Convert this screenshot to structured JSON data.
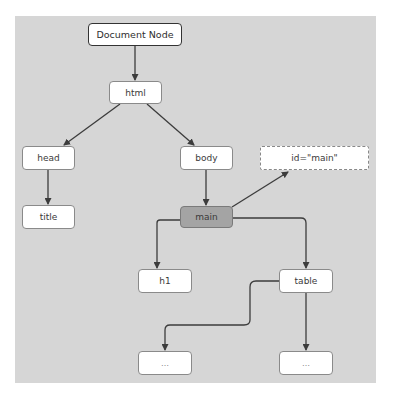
{
  "diagram": {
    "nodes": {
      "document": {
        "label": "Document Node"
      },
      "html": {
        "label": "html"
      },
      "head": {
        "label": "head"
      },
      "body": {
        "label": "body"
      },
      "title": {
        "label": "title"
      },
      "main": {
        "label": "main",
        "highlighted": true
      },
      "id_attr": {
        "label": "id=\"main\"",
        "style": "dashed"
      },
      "h1": {
        "label": "h1"
      },
      "table": {
        "label": "table"
      },
      "ellipsis_left": {
        "label": "…"
      },
      "ellipsis_right": {
        "label": "…"
      }
    },
    "edges": [
      {
        "from": "document",
        "to": "html"
      },
      {
        "from": "html",
        "to": "head"
      },
      {
        "from": "html",
        "to": "body"
      },
      {
        "from": "head",
        "to": "title"
      },
      {
        "from": "body",
        "to": "main"
      },
      {
        "from": "main",
        "to": "id_attr"
      },
      {
        "from": "main",
        "to": "h1"
      },
      {
        "from": "main",
        "to": "table"
      },
      {
        "from": "table",
        "to": "ellipsis_left"
      },
      {
        "from": "table",
        "to": "ellipsis_right"
      }
    ],
    "colors": {
      "background": "#d6d6d6",
      "node_fill": "#ffffff",
      "highlight_fill": "#a4a4a4",
      "edge": "#3c3c3c"
    }
  }
}
